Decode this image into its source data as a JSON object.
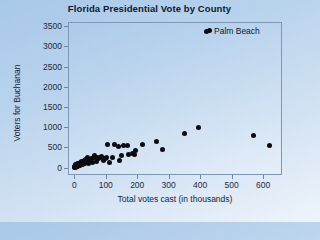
{
  "chart_data": {
    "type": "scatter",
    "title": "Florida Presidential Vote by County",
    "xlabel": "Total votes cast (in thousands)",
    "ylabel": "Voters for Buchanan",
    "xlim": [
      -20,
      660
    ],
    "ylim": [
      -180,
      3600
    ],
    "xticks": [
      0,
      100,
      200,
      300,
      400,
      500,
      600
    ],
    "yticks": [
      0,
      500,
      1000,
      1500,
      2000,
      2500,
      3000,
      3500
    ],
    "grid": false,
    "legend": "none",
    "marker_color": "#0b0b10",
    "annotations": [
      {
        "label": "Palm Beach",
        "x": 430,
        "y": 3400,
        "note": "outlier county marked with labeled point"
      }
    ],
    "points": [
      {
        "x": 430,
        "y": 3400,
        "label": "Palm Beach"
      },
      {
        "x": 620,
        "y": 560
      },
      {
        "x": 570,
        "y": 790
      },
      {
        "x": 395,
        "y": 1000
      },
      {
        "x": 350,
        "y": 840
      },
      {
        "x": 280,
        "y": 460
      },
      {
        "x": 262,
        "y": 650
      },
      {
        "x": 216,
        "y": 570
      },
      {
        "x": 196,
        "y": 420
      },
      {
        "x": 190,
        "y": 330
      },
      {
        "x": 186,
        "y": 360
      },
      {
        "x": 172,
        "y": 330
      },
      {
        "x": 168,
        "y": 550
      },
      {
        "x": 156,
        "y": 560
      },
      {
        "x": 150,
        "y": 300
      },
      {
        "x": 143,
        "y": 190
      },
      {
        "x": 140,
        "y": 530
      },
      {
        "x": 128,
        "y": 570
      },
      {
        "x": 122,
        "y": 260
      },
      {
        "x": 113,
        "y": 130
      },
      {
        "x": 106,
        "y": 570
      },
      {
        "x": 101,
        "y": 250
      },
      {
        "x": 98,
        "y": 235
      },
      {
        "x": 92,
        "y": 180
      },
      {
        "x": 86,
        "y": 270
      },
      {
        "x": 82,
        "y": 250
      },
      {
        "x": 78,
        "y": 230
      },
      {
        "x": 74,
        "y": 255
      },
      {
        "x": 70,
        "y": 150
      },
      {
        "x": 66,
        "y": 245
      },
      {
        "x": 64,
        "y": 300
      },
      {
        "x": 60,
        "y": 260
      },
      {
        "x": 57,
        "y": 120
      },
      {
        "x": 54,
        "y": 230
      },
      {
        "x": 51,
        "y": 180
      },
      {
        "x": 48,
        "y": 210
      },
      {
        "x": 45,
        "y": 100
      },
      {
        "x": 43,
        "y": 160
      },
      {
        "x": 41,
        "y": 250
      },
      {
        "x": 38,
        "y": 140
      },
      {
        "x": 36,
        "y": 195
      },
      {
        "x": 34,
        "y": 110
      },
      {
        "x": 32,
        "y": 170
      },
      {
        "x": 30,
        "y": 95
      },
      {
        "x": 28,
        "y": 145
      },
      {
        "x": 26,
        "y": 80
      },
      {
        "x": 25,
        "y": 120
      },
      {
        "x": 23,
        "y": 160
      },
      {
        "x": 22,
        "y": 70
      },
      {
        "x": 20,
        "y": 105
      },
      {
        "x": 19,
        "y": 135
      },
      {
        "x": 18,
        "y": 60
      },
      {
        "x": 17,
        "y": 90
      },
      {
        "x": 16,
        "y": 45
      },
      {
        "x": 15,
        "y": 75
      },
      {
        "x": 14,
        "y": 110
      },
      {
        "x": 13,
        "y": 55
      },
      {
        "x": 12,
        "y": 85
      },
      {
        "x": 11,
        "y": 35
      },
      {
        "x": 10,
        "y": 65
      },
      {
        "x": 9,
        "y": 95
      },
      {
        "x": 8,
        "y": 30
      },
      {
        "x": 7,
        "y": 55
      },
      {
        "x": 6,
        "y": 20
      },
      {
        "x": 5,
        "y": 45
      },
      {
        "x": 4,
        "y": 70
      },
      {
        "x": 3,
        "y": 15
      },
      {
        "x": 2,
        "y": 35
      },
      {
        "x": 1,
        "y": 10
      }
    ]
  }
}
